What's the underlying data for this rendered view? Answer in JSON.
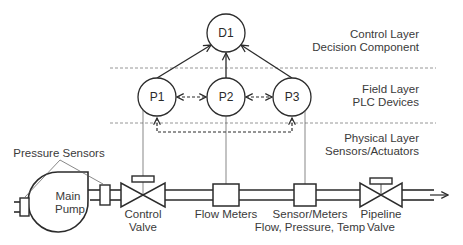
{
  "diagram": {
    "layers": [
      {
        "name": "Control Layer",
        "subtitle": "Decision Component"
      },
      {
        "name": "Field Layer",
        "subtitle": "PLC Devices"
      },
      {
        "name": "Physical Layer",
        "subtitle": "Sensors/Actuators"
      }
    ],
    "nodes": {
      "d1": "D1",
      "p1": "P1",
      "p2": "P2",
      "p3": "P3"
    },
    "components": {
      "pressure_sensors": "Pressure Sensors",
      "main_pump_line1": "Main",
      "main_pump_line2": "Pump",
      "control_valve_line1": "Control",
      "control_valve_line2": "Valve",
      "flow_meters": "Flow Meters",
      "sensor_meters_line1": "Sensor/Meters",
      "sensor_meters_line2": "Flow, Pressure, Temp",
      "pipeline_valve_line1": "Pipeline",
      "pipeline_valve_line2": "Valve"
    },
    "colors": {
      "stroke": "#2b2b2b",
      "divider": "#8a8a8a",
      "text": "#3a3a3a"
    }
  }
}
